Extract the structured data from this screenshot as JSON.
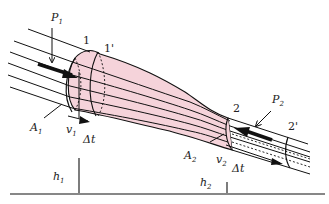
{
  "diagram": {
    "colors": {
      "tube_fill": "#f5d3da",
      "stroke": "#111111",
      "background": "#ffffff"
    },
    "labels": {
      "p1_main": "P",
      "p1_sub": "1",
      "p2_main": "P",
      "p2_sub": "2",
      "section_1": "1",
      "section_1_prime": "1'",
      "section_2": "2",
      "section_2_prime": "2'",
      "a1_main": "A",
      "a1_sub": "1",
      "a2_main": "A",
      "a2_sub": "2",
      "v1_main": "v",
      "v1_sub": "1",
      "v2_main": "v",
      "v2_sub": "2",
      "dt1": "Δt",
      "dt2": "Δt",
      "h1_main": "h",
      "h1_sub": "1",
      "h2_main": "h",
      "h2_sub": "2"
    }
  }
}
